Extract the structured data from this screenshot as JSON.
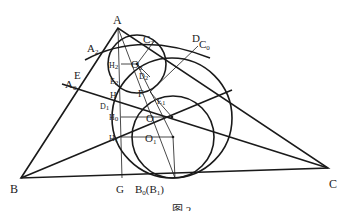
{
  "figure": {
    "caption": "图 2",
    "stroke_color": "#1a1a1a",
    "background": "#ffffff"
  },
  "labels": {
    "A": "A",
    "B": "B",
    "C": "C",
    "A2": "A",
    "A2_sub": "2",
    "C2": "C",
    "C2_sub": "2",
    "D": "D",
    "C0": "C",
    "C0_sub": "0",
    "E": "E",
    "A0": "A",
    "A0_sub": "0",
    "H2": "H",
    "H2_sub": "2",
    "O2": "O",
    "O2_sub": "2",
    "E2": "E",
    "E2_sub": "2",
    "D2": "D",
    "D2_sub": "2",
    "H": "H",
    "F": "F",
    "D1": "D",
    "D1_sub": "1",
    "E1": "E",
    "E1_sub": "1",
    "H0": "H",
    "H0_sub": "0",
    "O": "O",
    "H1": "H",
    "H1_sub": "1",
    "O1": "O",
    "O1_sub": "1",
    "G": "G",
    "B0B1": "B",
    "B0B1_sub": "0",
    "B0B1_paren": "(B",
    "B0B1_paren_sub": "1",
    "B0B1_close": ")"
  }
}
